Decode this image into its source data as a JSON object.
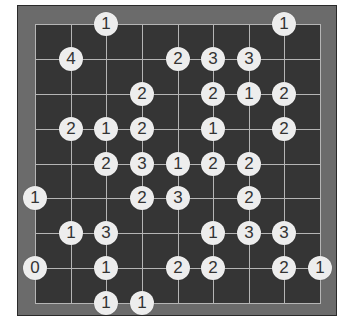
{
  "game": {
    "type": "Hashiwokakero (Bridges)",
    "grid": {
      "cols": 9,
      "rows": 9
    },
    "colors": {
      "frame": "#6b6b6b",
      "board": "#353535",
      "gridline": "#b5b5b5",
      "island_fill": "#ededed",
      "island_text": "#333333"
    },
    "islands": [
      {
        "row": 0,
        "col": 2,
        "value": "1"
      },
      {
        "row": 0,
        "col": 7,
        "value": "1"
      },
      {
        "row": 1,
        "col": 1,
        "value": "4"
      },
      {
        "row": 1,
        "col": 4,
        "value": "2"
      },
      {
        "row": 1,
        "col": 5,
        "value": "3"
      },
      {
        "row": 1,
        "col": 6,
        "value": "3"
      },
      {
        "row": 2,
        "col": 3,
        "value": "2"
      },
      {
        "row": 2,
        "col": 5,
        "value": "2"
      },
      {
        "row": 2,
        "col": 6,
        "value": "1"
      },
      {
        "row": 2,
        "col": 7,
        "value": "2"
      },
      {
        "row": 3,
        "col": 1,
        "value": "2"
      },
      {
        "row": 3,
        "col": 2,
        "value": "1"
      },
      {
        "row": 3,
        "col": 3,
        "value": "2"
      },
      {
        "row": 3,
        "col": 5,
        "value": "1"
      },
      {
        "row": 3,
        "col": 7,
        "value": "2"
      },
      {
        "row": 4,
        "col": 2,
        "value": "2"
      },
      {
        "row": 4,
        "col": 3,
        "value": "3"
      },
      {
        "row": 4,
        "col": 4,
        "value": "1"
      },
      {
        "row": 4,
        "col": 5,
        "value": "2"
      },
      {
        "row": 4,
        "col": 6,
        "value": "2"
      },
      {
        "row": 5,
        "col": 0,
        "value": "1"
      },
      {
        "row": 5,
        "col": 3,
        "value": "2"
      },
      {
        "row": 5,
        "col": 4,
        "value": "3"
      },
      {
        "row": 5,
        "col": 6,
        "value": "2"
      },
      {
        "row": 6,
        "col": 1,
        "value": "1"
      },
      {
        "row": 6,
        "col": 2,
        "value": "3"
      },
      {
        "row": 6,
        "col": 5,
        "value": "1"
      },
      {
        "row": 6,
        "col": 6,
        "value": "3"
      },
      {
        "row": 6,
        "col": 7,
        "value": "3"
      },
      {
        "row": 7,
        "col": 0,
        "value": "0"
      },
      {
        "row": 7,
        "col": 2,
        "value": "1"
      },
      {
        "row": 7,
        "col": 4,
        "value": "2"
      },
      {
        "row": 7,
        "col": 5,
        "value": "2"
      },
      {
        "row": 7,
        "col": 7,
        "value": "2"
      },
      {
        "row": 7,
        "col": 8,
        "value": "1"
      },
      {
        "row": 8,
        "col": 2,
        "value": "1"
      },
      {
        "row": 8,
        "col": 3,
        "value": "1"
      }
    ]
  }
}
